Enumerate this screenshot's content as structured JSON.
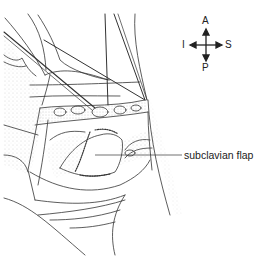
{
  "figure": {
    "type": "surgical line illustration",
    "ink_color": "#333333",
    "stipple_color": "#9a9a9a",
    "background": "#ffffff"
  },
  "orientation_compass": {
    "top": "A",
    "bottom": "P",
    "left": "I",
    "right": "S"
  },
  "labels": [
    {
      "text": "subclavian flap"
    }
  ]
}
